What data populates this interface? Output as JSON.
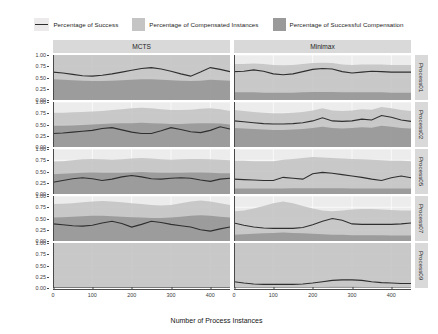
{
  "legend": {
    "items": [
      {
        "label": "Percentage of Success",
        "key": "line-key",
        "color": "#2f2f2f"
      },
      {
        "label": "Percentage of Compensated Instances",
        "key": "box-key",
        "color": "#c4c4c4"
      },
      {
        "label": "Percentage of Successful Compensation",
        "key": "box-key",
        "color": "#9a9a9a"
      }
    ]
  },
  "axes": {
    "x_title": "Number of Process Instances",
    "x_ticks": [
      "0",
      "100",
      "200",
      "300",
      "400"
    ],
    "y_ticks": [
      "1.00",
      "0.75",
      "0.50",
      "0.25",
      "0.00"
    ]
  },
  "columns": [
    "MCTS",
    "Minimax"
  ],
  "rows": [
    "Process01",
    "Process02",
    "Process05",
    "Process07",
    "Process09"
  ],
  "chart_data": {
    "type": "area",
    "title": "",
    "xlabel": "Number of Process Instances",
    "ylabel": "",
    "xlim": [
      0,
      450
    ],
    "ylim": [
      0,
      1
    ],
    "grid": true,
    "legend_position": "top",
    "facet_columns": [
      "MCTS",
      "Minimax"
    ],
    "facet_rows": [
      "Process01",
      "Process02",
      "Process05",
      "Process07",
      "Process09"
    ],
    "series_names": [
      "Percentage of Success",
      "Percentage of Compensated Instances",
      "Percentage of Successful Compensation"
    ],
    "x": [
      0,
      25,
      50,
      75,
      100,
      125,
      150,
      175,
      200,
      225,
      250,
      275,
      300,
      325,
      350,
      375,
      400,
      425,
      450
    ],
    "panels": [
      {
        "row": "Process01",
        "column": "MCTS",
        "success": [
          0.62,
          0.6,
          0.57,
          0.54,
          0.53,
          0.55,
          0.58,
          0.62,
          0.66,
          0.7,
          0.72,
          0.69,
          0.64,
          0.58,
          0.53,
          0.62,
          0.72,
          0.68,
          0.63
        ],
        "compensated": [
          1.0,
          1.0,
          1.0,
          1.0,
          1.0,
          1.0,
          1.0,
          1.0,
          1.0,
          1.0,
          1.0,
          1.0,
          1.0,
          1.0,
          1.0,
          1.0,
          1.0,
          1.0,
          1.0
        ],
        "successful_compensation": [
          0.46,
          0.45,
          0.44,
          0.43,
          0.42,
          0.42,
          0.43,
          0.44,
          0.45,
          0.46,
          0.46,
          0.45,
          0.44,
          0.43,
          0.42,
          0.43,
          0.45,
          0.44,
          0.43
        ]
      },
      {
        "row": "Process01",
        "column": "Minimax",
        "success": [
          0.63,
          0.64,
          0.67,
          0.64,
          0.58,
          0.56,
          0.58,
          0.63,
          0.68,
          0.7,
          0.69,
          0.63,
          0.6,
          0.62,
          0.64,
          0.63,
          0.62,
          0.62,
          0.62
        ],
        "compensated": [
          0.8,
          0.8,
          0.81,
          0.8,
          0.78,
          0.77,
          0.78,
          0.8,
          0.82,
          0.83,
          0.82,
          0.79,
          0.78,
          0.79,
          0.79,
          0.79,
          0.78,
          0.78,
          0.78
        ],
        "successful_compensation": [
          0.17,
          0.17,
          0.17,
          0.16,
          0.16,
          0.16,
          0.16,
          0.17,
          0.18,
          0.18,
          0.18,
          0.17,
          0.17,
          0.17,
          0.17,
          0.17,
          0.16,
          0.16,
          0.16
        ]
      },
      {
        "row": "Process02",
        "column": "MCTS",
        "success": [
          0.3,
          0.31,
          0.33,
          0.35,
          0.37,
          0.41,
          0.43,
          0.38,
          0.33,
          0.3,
          0.3,
          0.36,
          0.43,
          0.39,
          0.34,
          0.32,
          0.37,
          0.45,
          0.4
        ],
        "compensated": [
          0.76,
          0.76,
          0.77,
          0.78,
          0.79,
          0.8,
          0.82,
          0.84,
          0.86,
          0.87,
          0.86,
          0.84,
          0.82,
          0.82,
          0.83,
          0.85,
          0.86,
          0.84,
          0.8
        ],
        "successful_compensation": [
          0.47,
          0.47,
          0.48,
          0.49,
          0.5,
          0.51,
          0.52,
          0.53,
          0.53,
          0.54,
          0.53,
          0.52,
          0.51,
          0.51,
          0.52,
          0.53,
          0.53,
          0.52,
          0.5
        ]
      },
      {
        "row": "Process02",
        "column": "Minimax",
        "success": [
          0.58,
          0.56,
          0.54,
          0.52,
          0.51,
          0.51,
          0.52,
          0.54,
          0.58,
          0.65,
          0.58,
          0.57,
          0.58,
          0.62,
          0.6,
          0.7,
          0.66,
          0.6,
          0.57
        ],
        "compensated": [
          0.82,
          0.8,
          0.78,
          0.76,
          0.75,
          0.75,
          0.76,
          0.78,
          0.81,
          0.86,
          0.81,
          0.8,
          0.81,
          0.84,
          0.83,
          0.89,
          0.86,
          0.82,
          0.8
        ],
        "successful_compensation": [
          0.42,
          0.41,
          0.4,
          0.39,
          0.38,
          0.38,
          0.39,
          0.4,
          0.42,
          0.45,
          0.42,
          0.41,
          0.42,
          0.44,
          0.43,
          0.47,
          0.45,
          0.42,
          0.41
        ]
      },
      {
        "row": "Process05",
        "column": "MCTS",
        "success": [
          0.26,
          0.3,
          0.34,
          0.36,
          0.34,
          0.3,
          0.33,
          0.38,
          0.41,
          0.38,
          0.34,
          0.33,
          0.35,
          0.36,
          0.35,
          0.31,
          0.28,
          0.33,
          0.35
        ],
        "compensated": [
          0.72,
          0.73,
          0.75,
          0.77,
          0.78,
          0.77,
          0.76,
          0.77,
          0.79,
          0.8,
          0.79,
          0.77,
          0.76,
          0.77,
          0.78,
          0.78,
          0.77,
          0.76,
          0.75
        ],
        "successful_compensation": [
          0.44,
          0.45,
          0.46,
          0.47,
          0.48,
          0.47,
          0.47,
          0.47,
          0.48,
          0.49,
          0.48,
          0.47,
          0.47,
          0.47,
          0.48,
          0.48,
          0.47,
          0.46,
          0.46
        ]
      },
      {
        "row": "Process05",
        "column": "Minimax",
        "success": [
          0.33,
          0.32,
          0.31,
          0.3,
          0.3,
          0.37,
          0.35,
          0.33,
          0.45,
          0.48,
          0.46,
          0.43,
          0.4,
          0.37,
          0.33,
          0.3,
          0.36,
          0.4,
          0.36
        ],
        "compensated": [
          0.74,
          0.74,
          0.73,
          0.73,
          0.73,
          0.76,
          0.78,
          0.8,
          0.82,
          0.81,
          0.8,
          0.79,
          0.78,
          0.77,
          0.76,
          0.75,
          0.74,
          0.74,
          0.73
        ],
        "successful_compensation": [
          0.12,
          0.12,
          0.12,
          0.12,
          0.12,
          0.12,
          0.13,
          0.13,
          0.13,
          0.13,
          0.13,
          0.13,
          0.12,
          0.12,
          0.12,
          0.12,
          0.12,
          0.12,
          0.12
        ]
      },
      {
        "row": "Process07",
        "column": "MCTS",
        "success": [
          0.38,
          0.36,
          0.34,
          0.33,
          0.35,
          0.4,
          0.44,
          0.39,
          0.31,
          0.37,
          0.44,
          0.41,
          0.37,
          0.34,
          0.31,
          0.25,
          0.22,
          0.27,
          0.31
        ],
        "compensated": [
          0.82,
          0.83,
          0.84,
          0.86,
          0.88,
          0.89,
          0.88,
          0.86,
          0.84,
          0.82,
          0.8,
          0.79,
          0.8,
          0.84,
          0.88,
          0.9,
          0.88,
          0.84,
          0.8
        ],
        "successful_compensation": [
          0.52,
          0.53,
          0.54,
          0.55,
          0.56,
          0.56,
          0.55,
          0.54,
          0.53,
          0.52,
          0.51,
          0.51,
          0.52,
          0.54,
          0.56,
          0.57,
          0.56,
          0.54,
          0.52
        ]
      },
      {
        "row": "Process07",
        "column": "Minimax",
        "success": [
          0.4,
          0.35,
          0.31,
          0.29,
          0.28,
          0.28,
          0.28,
          0.3,
          0.36,
          0.44,
          0.5,
          0.46,
          0.38,
          0.37,
          0.37,
          0.37,
          0.37,
          0.38,
          0.4
        ],
        "compensated": [
          0.66,
          0.68,
          0.72,
          0.78,
          0.84,
          0.88,
          0.84,
          0.78,
          0.72,
          0.68,
          0.66,
          0.68,
          0.7,
          0.71,
          0.71,
          0.7,
          0.69,
          0.68,
          0.68
        ],
        "successful_compensation": [
          0.14,
          0.15,
          0.16,
          0.17,
          0.18,
          0.19,
          0.18,
          0.17,
          0.16,
          0.15,
          0.14,
          0.14,
          0.13,
          0.13,
          0.13,
          0.13,
          0.12,
          0.12,
          0.12
        ]
      },
      {
        "row": "Process09",
        "column": "MCTS",
        "success": [
          0.0,
          0.0,
          0.0,
          0.0,
          0.0,
          0.0,
          0.0,
          0.0,
          0.0,
          0.0,
          0.0,
          0.0,
          0.0,
          0.0,
          0.0,
          0.0,
          0.0,
          0.0,
          0.0
        ],
        "compensated": [
          1.0,
          1.0,
          1.0,
          1.0,
          1.0,
          1.0,
          1.0,
          1.0,
          1.0,
          1.0,
          1.0,
          1.0,
          1.0,
          1.0,
          1.0,
          1.0,
          1.0,
          1.0,
          1.0
        ],
        "successful_compensation": [
          0.0,
          0.0,
          0.0,
          0.0,
          0.0,
          0.0,
          0.0,
          0.0,
          0.0,
          0.0,
          0.0,
          0.0,
          0.0,
          0.0,
          0.0,
          0.0,
          0.0,
          0.0,
          0.0
        ]
      },
      {
        "row": "Process09",
        "column": "Minimax",
        "success": [
          0.14,
          0.11,
          0.09,
          0.08,
          0.08,
          0.08,
          0.08,
          0.09,
          0.11,
          0.14,
          0.17,
          0.18,
          0.18,
          0.17,
          0.14,
          0.12,
          0.11,
          0.1,
          0.1
        ],
        "compensated": [
          1.0,
          1.0,
          1.0,
          1.0,
          1.0,
          1.0,
          1.0,
          1.0,
          1.0,
          1.0,
          1.0,
          1.0,
          1.0,
          1.0,
          1.0,
          1.0,
          1.0,
          1.0,
          1.0
        ],
        "successful_compensation": [
          0.02,
          0.02,
          0.02,
          0.02,
          0.02,
          0.02,
          0.02,
          0.02,
          0.02,
          0.02,
          0.03,
          0.03,
          0.03,
          0.02,
          0.02,
          0.02,
          0.02,
          0.02,
          0.02
        ]
      }
    ]
  },
  "colors": {
    "panel_bg": "#ececec",
    "strip_bg": "#d9d9d9",
    "band_compensated": "#c4c4c4",
    "band_successful": "#9a9a9a",
    "line": "#2f2f2f",
    "grid": "#ffffff"
  }
}
